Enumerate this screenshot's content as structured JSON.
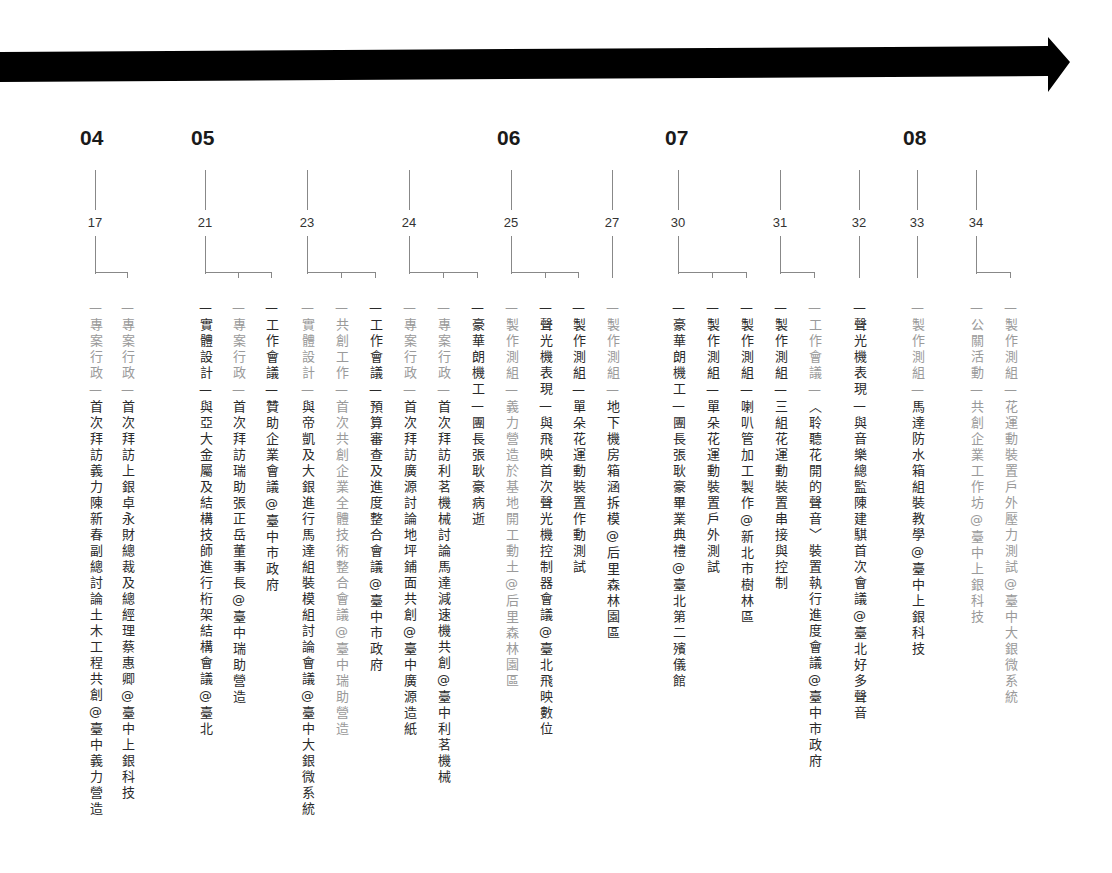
{
  "title": "",
  "timeline_arrow": {
    "color": "#000000"
  },
  "months": [
    {
      "label": "04",
      "x": 82
    },
    {
      "label": "05",
      "x": 193
    },
    {
      "label": "06",
      "x": 499
    },
    {
      "label": "07",
      "x": 667
    },
    {
      "label": "08",
      "x": 905
    }
  ],
  "days": [
    {
      "label": "17",
      "x": 95,
      "branches": [
        95,
        127
      ]
    },
    {
      "label": "21",
      "x": 205,
      "branches": [
        205,
        238,
        271
      ]
    },
    {
      "label": "23",
      "x": 307,
      "branches": [
        307,
        341,
        375
      ]
    },
    {
      "label": "24",
      "x": 409,
      "branches": [
        409,
        443,
        477
      ]
    },
    {
      "label": "25",
      "x": 511,
      "branches": [
        511,
        545,
        578
      ]
    },
    {
      "label": "27",
      "x": 612,
      "branches": [
        612
      ]
    },
    {
      "label": "30",
      "x": 678,
      "branches": [
        678,
        712,
        746
      ]
    },
    {
      "label": "31",
      "x": 780,
      "branches": [
        780,
        814
      ]
    },
    {
      "label": "32",
      "x": 859,
      "branches": [
        859
      ]
    },
    {
      "label": "33",
      "x": 917,
      "branches": [
        917
      ]
    },
    {
      "label": "34",
      "x": 976,
      "branches": [
        976,
        1010
      ]
    }
  ],
  "events": [
    {
      "x": 95,
      "tone": "dark",
      "text": "—專案行政—首次拜訪義力陳新春副總討論土木工程共創@臺中義力營造",
      "category_tone": "light"
    },
    {
      "x": 127,
      "tone": "dark",
      "text": "—專案行政—首次拜訪上銀卓永財總裁及總經理蔡惠卿@臺中上銀科技",
      "category_tone": "light"
    },
    {
      "x": 205,
      "tone": "dark",
      "text": "—實體設計—與亞大金屬及結構技師進行桁架結構會議@臺北",
      "category_tone": "dark"
    },
    {
      "x": 238,
      "tone": "dark",
      "text": "—專案行政—首次拜訪瑞助張正岳董事長@臺中瑞助營造",
      "category_tone": "light"
    },
    {
      "x": 271,
      "tone": "dark",
      "text": "—工作會議—贊助企業會議@臺中市政府",
      "category_tone": "dark"
    },
    {
      "x": 307,
      "tone": "dark",
      "text": "—實體設計—與帝凱及大銀進行馬達組裝模組討論會議@臺中大銀微系統",
      "category_tone": "light"
    },
    {
      "x": 341,
      "tone": "light",
      "text": "—共創工作—首次共創企業全體技術整合會議@臺中瑞助營造",
      "category_tone": "light"
    },
    {
      "x": 375,
      "tone": "dark",
      "text": "—工作會議—預算審查及進度整合會議@臺中市政府",
      "category_tone": "dark"
    },
    {
      "x": 409,
      "tone": "dark",
      "text": "—專案行政—首次拜訪廣源討論地坪鋪面共創@臺中廣源造紙",
      "category_tone": "light"
    },
    {
      "x": 443,
      "tone": "dark",
      "text": "—專案行政—首次拜訪利茗機械討論馬達減速機共創@臺中利茗機械",
      "category_tone": "light"
    },
    {
      "x": 477,
      "tone": "dark",
      "text": "—豪華朗機工—團長張耿豪病逝",
      "category_tone": "dark"
    },
    {
      "x": 511,
      "tone": "light",
      "text": "—製作測組—義力營造於基地開工動土@后里森林園區",
      "category_tone": "light"
    },
    {
      "x": 545,
      "tone": "dark",
      "text": "—聲光機表現—與飛映首次聲光機控制器會議@臺北飛映數位",
      "category_tone": "dark"
    },
    {
      "x": 578,
      "tone": "dark",
      "text": "—製作測組—單朵花運動裝置作動測試",
      "category_tone": "dark"
    },
    {
      "x": 612,
      "tone": "dark",
      "text": "—製作測組—地下機房箱涵拆模@后里森林園區",
      "category_tone": "light"
    },
    {
      "x": 678,
      "tone": "dark",
      "text": "—豪華朗機工—團長張耿豪畢業典禮@臺北第二殯儀館",
      "category_tone": "dark"
    },
    {
      "x": 712,
      "tone": "dark",
      "text": "—製作測組—單朵花運動裝置戶外測試",
      "category_tone": "dark"
    },
    {
      "x": 746,
      "tone": "dark",
      "text": "—製作測組—喇叭管加工製作@新北市樹林區",
      "category_tone": "dark"
    },
    {
      "x": 780,
      "tone": "dark",
      "text": "—製作測組—三組花運動裝置串接與控制",
      "category_tone": "dark"
    },
    {
      "x": 814,
      "tone": "dark",
      "text": "—工作會議—︿聆聽花開的聲音﹀裝置執行進度會議@臺中市政府",
      "category_tone": "light"
    },
    {
      "x": 859,
      "tone": "dark",
      "text": "—聲光機表現—與音樂總監陳建騏首次會議@臺北好多聲音",
      "category_tone": "dark"
    },
    {
      "x": 917,
      "tone": "dark",
      "text": "—製作測組—馬達防水箱組裝教學@臺中上銀科技",
      "category_tone": "light"
    },
    {
      "x": 976,
      "tone": "light",
      "text": "—公關活動—共創企業工作坊@臺中上銀科技",
      "category_tone": "light"
    },
    {
      "x": 1010,
      "tone": "light",
      "text": "—製作測組—花運動裝置戶外壓力測試@臺中大銀微系統",
      "category_tone": "light"
    }
  ]
}
